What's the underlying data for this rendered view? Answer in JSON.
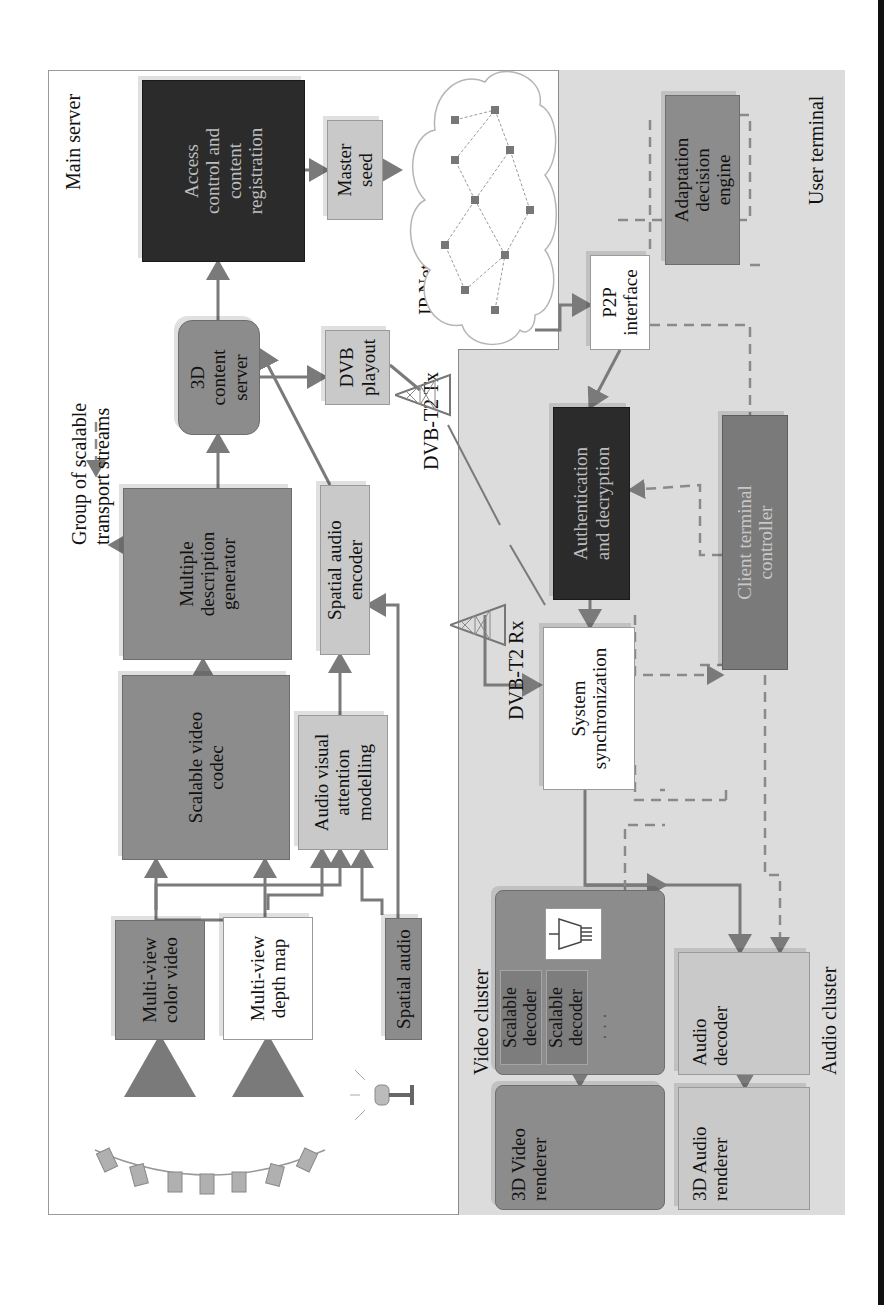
{
  "regions": {
    "main_server": "Main server",
    "user_terminal": "User terminal",
    "video_cluster": "Video cluster",
    "audio_cluster": "Audio cluster"
  },
  "labels": {
    "group_streams": "Group of scalable\ntransport streams",
    "ip_network": "IP Network",
    "dvb_tx": "DVB-T2 Tx",
    "dvb_rx": "DVB-T2 Rx"
  },
  "blocks": {
    "access_control": "Access\ncontrol and\ncontent\nregistration",
    "master_seed": "Master\nseed",
    "content_server": "3D\ncontent\nserver",
    "dvb_playout": "DVB\nplayout",
    "multiple_description": "Multiple\ndescription\ngenerator",
    "spatial_audio_encoder": "Spatial audio\nencoder",
    "scalable_video_codec": "Scalable video\ncodec",
    "av_attention": "Audio visual\nattention\nmodelling",
    "mv_color_video": "Multi-view\ncolor video",
    "mv_depth_map": "Multi-view\ndepth map",
    "spatial_audio": "Spatial audio",
    "p2p_interface": "P2P\ninterface",
    "adaptation_engine": "Adaptation\ndecision\nengine",
    "auth_decrypt": "Authentication\nand decryption",
    "client_controller": "Client terminal\ncontroller",
    "system_sync": "System\nsynchronization",
    "scalable_decoder_1": "Scalable\ndecoder",
    "scalable_decoder_2": "Scalable\ndecoder",
    "decoder_ellipsis": "· · ·",
    "video_renderer": "3D Video\nrenderer",
    "audio_decoder": "Audio\ndecoder",
    "audio_renderer": "3D Audio\nrenderer"
  },
  "icons": {
    "cameras": "camera-array-icon",
    "microphone": "microphone-icon",
    "tx_tower": "antenna-tower-icon",
    "rx_tower": "antenna-tower-icon",
    "demux": "demultiplexer-icon",
    "network": "network-cloud-icon"
  },
  "colors": {
    "dark": "#2b2b2b",
    "mid": "#8c8c8c",
    "light": "#c9c9c9",
    "terminal_bg": "#dcdcdc",
    "line": "#7a7a7a"
  }
}
